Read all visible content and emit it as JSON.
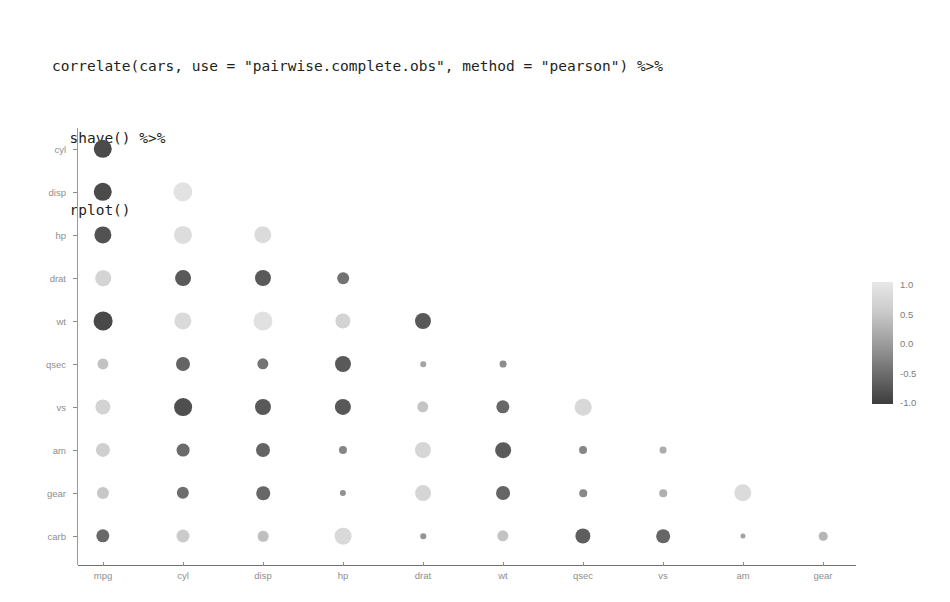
{
  "code": {
    "lines": [
      "correlate(cars, use = \"pairwise.complete.obs\", method = \"pearson\") %>%",
      "  shave() %>%",
      "  rplot()"
    ]
  },
  "legend": {
    "title": "",
    "ticks": [
      "1.0",
      "0.5",
      "0.0",
      "-0.5",
      "-1.0"
    ],
    "tick_values": [
      1.0,
      0.5,
      0.0,
      -0.5,
      -1.0
    ],
    "gradient_high_color": "#e8e8e8",
    "gradient_low_color": "#3d3d3d",
    "position": "right"
  },
  "chart_data": {
    "type": "heatmap",
    "subtype": "correlation-dot-matrix",
    "title": "",
    "xlabel": "",
    "ylabel": "",
    "grid": false,
    "legend_position": "right",
    "zlim": [
      -1.0,
      1.0
    ],
    "shaved": "upper-triangle-removed",
    "x_categories": [
      "mpg",
      "cyl",
      "disp",
      "hp",
      "drat",
      "wt",
      "qsec",
      "vs",
      "am",
      "gear"
    ],
    "y_categories": [
      "cyl",
      "disp",
      "hp",
      "drat",
      "wt",
      "qsec",
      "vs",
      "am",
      "gear",
      "carb"
    ],
    "rows": [
      {
        "term": "cyl",
        "values": [
          -0.85,
          null,
          null,
          null,
          null,
          null,
          null,
          null,
          null,
          null
        ]
      },
      {
        "term": "disp",
        "values": [
          -0.85,
          0.9,
          null,
          null,
          null,
          null,
          null,
          null,
          null,
          null
        ]
      },
      {
        "term": "hp",
        "values": [
          -0.78,
          0.83,
          0.79,
          null,
          null,
          null,
          null,
          null,
          null,
          null
        ]
      },
      {
        "term": "drat",
        "values": [
          0.68,
          -0.7,
          -0.71,
          -0.45,
          null,
          null,
          null,
          null,
          null,
          null
        ]
      },
      {
        "term": "wt",
        "values": [
          -0.87,
          0.78,
          0.89,
          0.66,
          -0.71,
          null,
          null,
          null,
          null,
          null
        ]
      },
      {
        "term": "qsec",
        "values": [
          0.42,
          -0.59,
          -0.43,
          -0.71,
          0.09,
          -0.17,
          null,
          null,
          null,
          null
        ]
      },
      {
        "term": "vs",
        "values": [
          0.66,
          -0.81,
          -0.71,
          -0.72,
          0.44,
          -0.55,
          0.74,
          null,
          null,
          null
        ]
      },
      {
        "term": "am",
        "values": [
          0.6,
          -0.52,
          -0.59,
          -0.24,
          0.71,
          -0.69,
          -0.23,
          0.17,
          null,
          null
        ]
      },
      {
        "term": "gear",
        "values": [
          0.48,
          -0.49,
          -0.56,
          -0.13,
          0.7,
          -0.58,
          -0.21,
          0.21,
          0.79,
          null
        ]
      },
      {
        "term": "carb",
        "values": [
          -0.55,
          0.53,
          0.39,
          0.75,
          -0.09,
          0.43,
          -0.66,
          -0.57,
          0.06,
          0.27
        ]
      }
    ]
  }
}
